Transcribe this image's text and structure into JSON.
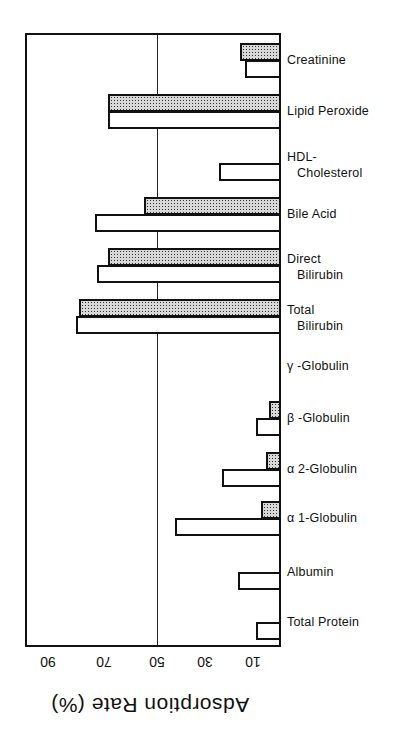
{
  "chart_data": {
    "type": "bar",
    "orientation": "horizontal",
    "title": "",
    "xlabel": "Adsorption Rate (%)",
    "ylabel": "",
    "xlim": [
      0,
      100
    ],
    "x_axis_reversed": true,
    "x_ticks": [
      90,
      70,
      50,
      30,
      10
    ],
    "reference_line": 50,
    "grid": false,
    "legend": null,
    "categories": [
      "Creatinine",
      "Lipid Peroxide",
      "HDL-Cholesterol",
      "Bile Acid",
      "Direct Bilirubin",
      "Total Bilirubin",
      "γ-Globulin",
      "β-Globulin",
      "α2-Globulin",
      "α1-Globulin",
      "Albumin",
      "Total Protein"
    ],
    "series": [
      {
        "name": "shaded",
        "pattern": "dotted",
        "values": [
          18,
          69,
          0,
          55,
          69,
          80,
          0,
          7,
          8,
          10,
          0,
          0
        ]
      },
      {
        "name": "white",
        "pattern": "open",
        "values": [
          16,
          69,
          26,
          74,
          73,
          81,
          0,
          12,
          25,
          43,
          19,
          12
        ]
      }
    ]
  },
  "labels": {
    "categories": [
      {
        "line1": "Creatinine",
        "line2": ""
      },
      {
        "line1": "Lipid Peroxide",
        "line2": ""
      },
      {
        "line1": "HDL-",
        "line2": "Cholesterol"
      },
      {
        "line1": "Bile Acid",
        "line2": ""
      },
      {
        "line1": "Direct",
        "line2": "Bilirubin"
      },
      {
        "line1": "Total",
        "line2": "Bilirubin"
      },
      {
        "line1": "γ -Globulin",
        "line2": ""
      },
      {
        "line1": "β -Globulin",
        "line2": ""
      },
      {
        "line1": "α 2-Globulin",
        "line2": ""
      },
      {
        "line1": "α 1-Globulin",
        "line2": ""
      },
      {
        "line1": "Albumin",
        "line2": ""
      },
      {
        "line1": "Total Protein",
        "line2": ""
      }
    ],
    "ticks": [
      "90",
      "70",
      "50",
      "30",
      "10"
    ],
    "axis_title": "Adsorption Rate (%)"
  }
}
